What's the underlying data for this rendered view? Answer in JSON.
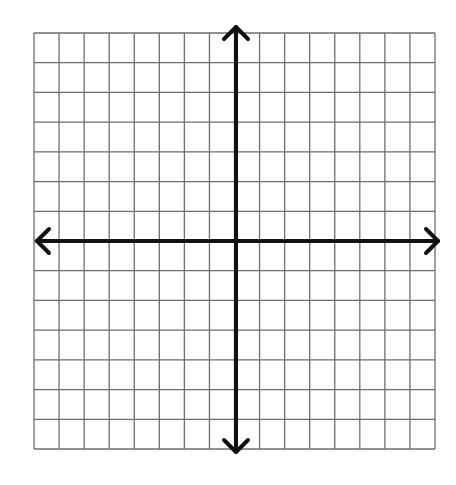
{
  "diagram": {
    "type": "coordinate-plane",
    "title": "",
    "grid": {
      "columns": 16,
      "rows": 14,
      "left": 34,
      "top": 33,
      "right": 435,
      "bottom": 449,
      "line_color": "#6e6e6e"
    },
    "axes": {
      "origin_x": 236,
      "origin_y": 241,
      "x_start": 37,
      "x_end": 438,
      "y_start": 27,
      "y_end": 452,
      "color": "#111111",
      "stroke_width": 4,
      "arrows": [
        "left",
        "right",
        "up",
        "down"
      ]
    },
    "labels": []
  }
}
